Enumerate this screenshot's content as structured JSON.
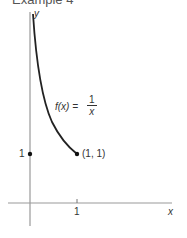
{
  "title": "Example 4",
  "axes": {
    "x_label": "x",
    "y_label": "y",
    "x_tick": "1",
    "y_tick": "1"
  },
  "function_label": {
    "lhs": "f(x) =",
    "numerator": "1",
    "denominator": "x"
  },
  "point_label": "(1, 1)",
  "colors": {
    "axis": "#999999",
    "curve": "#222222",
    "text": "#333333"
  }
}
